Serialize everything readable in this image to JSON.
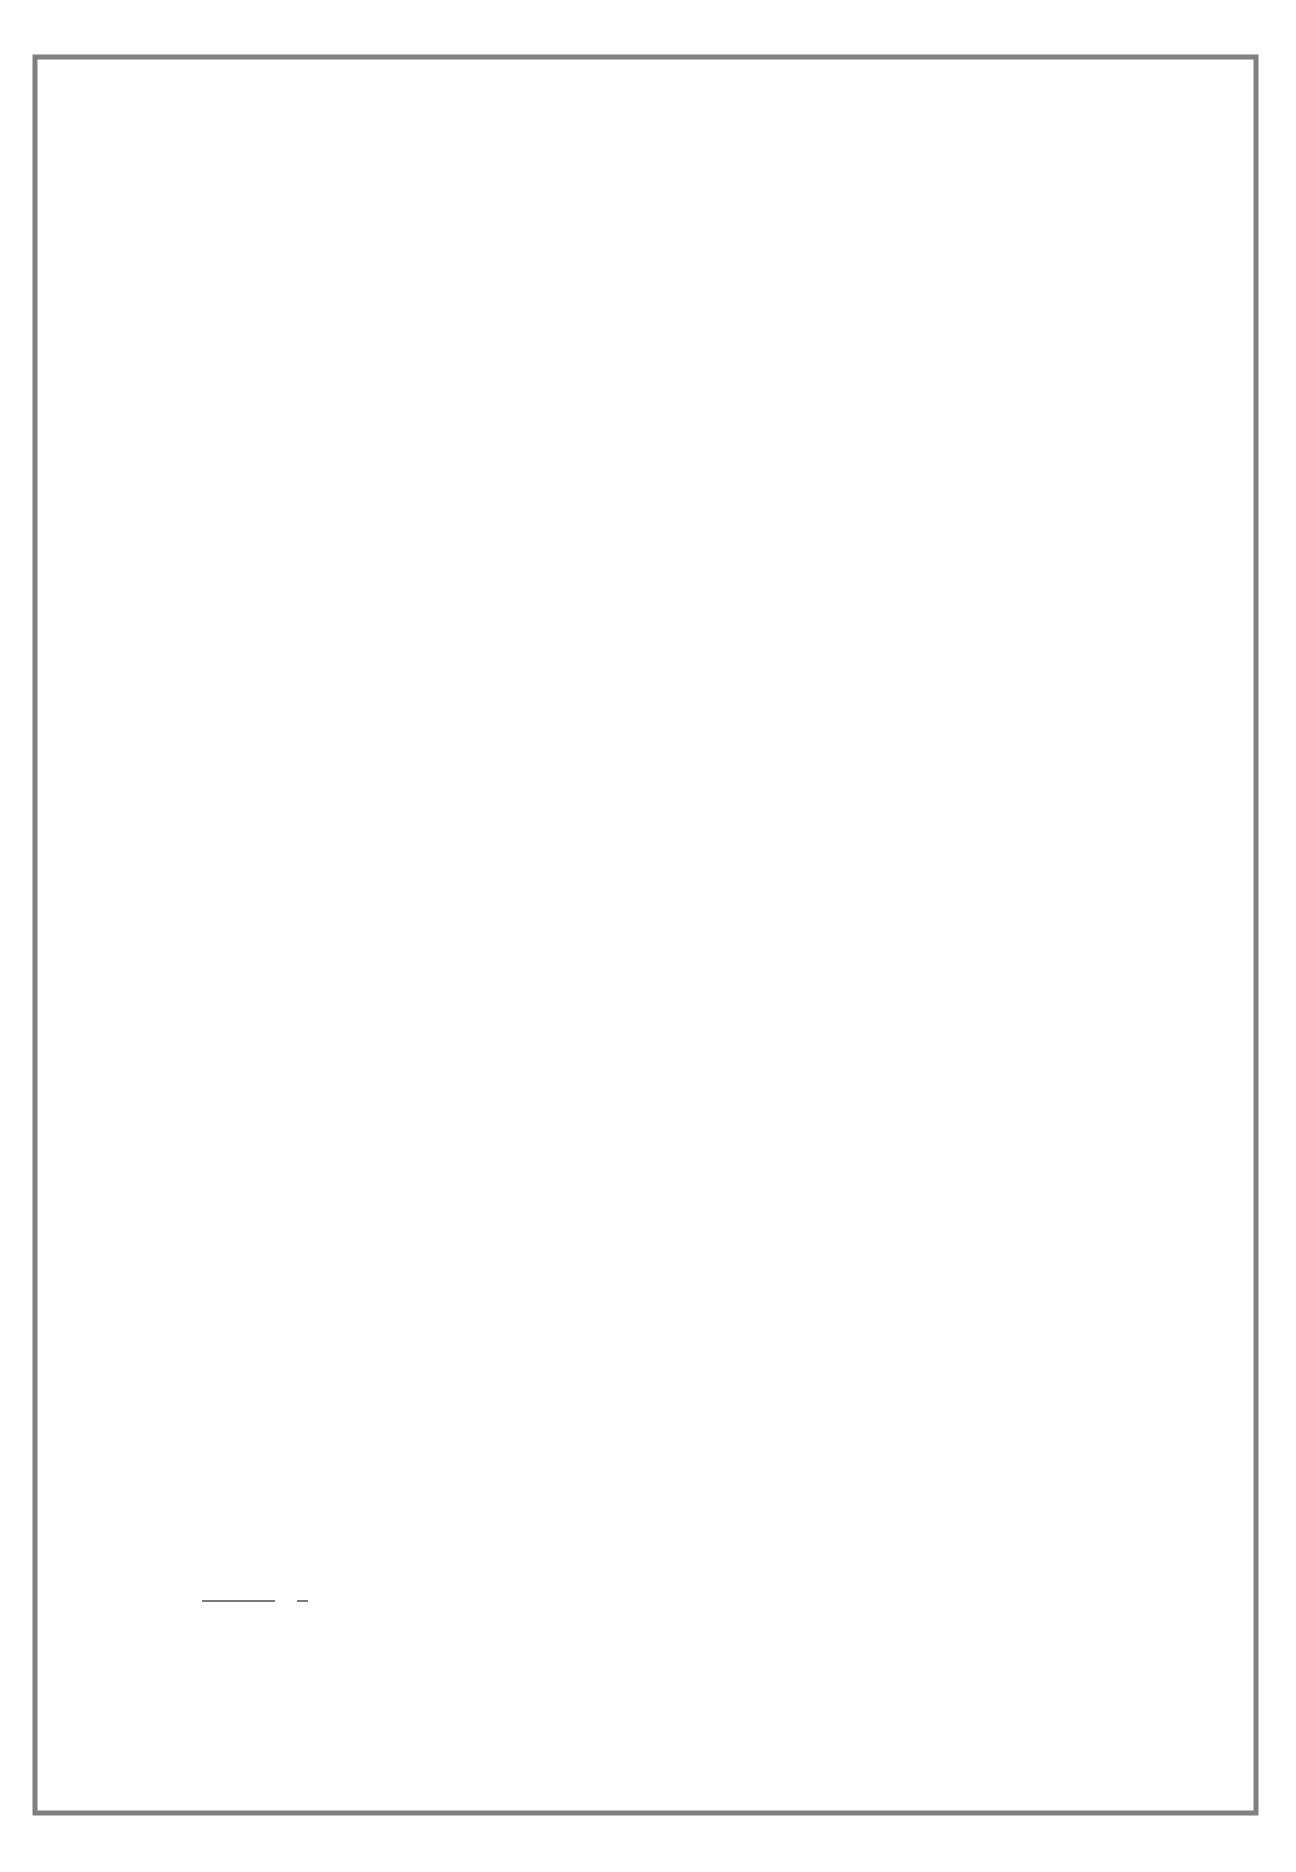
{
  "diagram": {
    "orientation": "rotated-90-ccw",
    "colors": {
      "frame": "#808080",
      "node_outline": "#1a1a1a",
      "node_fill_center": "#ffffff",
      "node_fill_edge": "#999999",
      "connector": "#7a7a7a"
    },
    "nodes": {
      "order_of_operations": {
        "lines": [
          "Order",
          "of",
          "Operations"
        ]
      },
      "multiply_divide_add_subtract": {
        "lines": [
          "Multiply",
          "Divide",
          "Add",
          "Subtract"
        ]
      },
      "fraction": {
        "lines": [
          "Fraction"
        ]
      },
      "fraction_rules": {
        "lines": [
          "Fraction",
          "Rules"
        ]
      },
      "reciprocal": {
        "lines": [
          "Reciprocal"
        ]
      },
      "any_number": {
        "lines": [
          "Any",
          "Number"
        ]
      },
      "intro_1": {
        "lines": [
          "Intro 1"
        ]
      },
      "calculator_key_1x": {
        "lines": [
          "Calculator Key",
          "1/X"
        ]
      },
      "infinity": {
        "lines": [
          "Infinity"
        ]
      },
      "infinity_symbol": {
        "lines": [
          "∞"
        ]
      },
      "skills": {
        "lines": [
          "Skills"
        ]
      },
      "powers": {
        "lines": [
          "Powers"
        ]
      },
      "roots": {
        "lines": [
          "Roots"
        ]
      },
      "calculator_key_ym": {
        "lines": [
          "Calculator Key",
          "YM"
        ]
      },
      "positive_negative_numbers": {
        "lines": [
          "Positive and Negative Numbers"
        ]
      },
      "equation_rearranging": {
        "lines": [
          "Equation Rearranging"
        ]
      },
      "proportion": {
        "lines": [
          "Proportion"
        ]
      },
      "powers_of_ten": {
        "lines": [
          "Powers of Ten"
        ]
      }
    },
    "links": {
      "order_are": {
        "lines": [
          "are"
        ]
      },
      "fraction_controlled": {
        "lines": [
          "are",
          "controlled",
          "by"
        ]
      },
      "reciprocal_is": {
        "lines": [
          "is"
        ]
      },
      "any_number_divided": {
        "lines": [
          "divided"
        ]
      },
      "intro_by_using": {
        "lines": [
          "by using"
        ]
      },
      "infinity_symbol_is": {
        "lines": [
          "symbol",
          "is"
        ]
      },
      "skills_in": {
        "lines": [
          "In"
        ]
      },
      "powers_roots_by_using": {
        "lines": [
          "by using"
        ]
      }
    }
  }
}
